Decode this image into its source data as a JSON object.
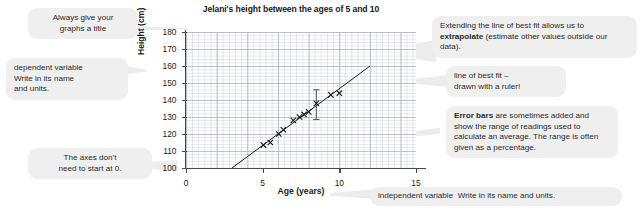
{
  "chart_data": {
    "type": "scatter",
    "title": "Jelani's height between the ages of 5 and 10",
    "xlabel": "Age (years)",
    "ylabel": "Height (cm)",
    "xlim": [
      0,
      15
    ],
    "ylim": [
      100,
      180
    ],
    "xticks": [
      0,
      5,
      10,
      15
    ],
    "yticks": [
      100,
      110,
      120,
      130,
      140,
      150,
      160,
      170,
      180
    ],
    "grid": true,
    "legend": "none",
    "marker": "x",
    "points": [
      {
        "x": 5.05,
        "y": 113.5
      },
      {
        "x": 5.5,
        "y": 115.0
      },
      {
        "x": 6.05,
        "y": 120.0
      },
      {
        "x": 6.35,
        "y": 122.5
      },
      {
        "x": 7.0,
        "y": 128.0
      },
      {
        "x": 7.4,
        "y": 130.0
      },
      {
        "x": 7.7,
        "y": 131.5
      },
      {
        "x": 8.0,
        "y": 133.0
      },
      {
        "x": 8.5,
        "y": 138.0
      },
      {
        "x": 9.45,
        "y": 143.0
      },
      {
        "x": 10.0,
        "y": 144.0
      }
    ],
    "error_bar": {
      "x": 8.5,
      "y": 138.0,
      "low": 128.5,
      "high": 146.0
    },
    "best_fit_line": {
      "x1": 3.0,
      "y1": 100.0,
      "x2": 12.0,
      "y2": 160.0
    }
  },
  "annotations": {
    "title_note": "Always give your\ngraphs a title",
    "dependent_note_line1": "dependent variable",
    "dependent_note_line2": "Write in its name",
    "dependent_note_line3": "and units.",
    "axes_note": "The axes don't\nneed to start at 0.",
    "extrapolate_pre": "Extending the line of best fit allows us to ",
    "extrapolate_bold": "extrapolate",
    "extrapolate_post": " (estimate other values outside our data).",
    "best_fit_note": "line of best fit –\ndrawn with a ruler!",
    "error_bars_bold": "Error bars",
    "error_bars_rest": " are sometimes added and show the range of readings used to calculate an average. The range is often given as a percentage.",
    "independent_note_bold": "independent variable",
    "independent_note_rest": "Write in its name and units."
  },
  "colors": {
    "bubble": "#efefef",
    "text": "#2b2b2b",
    "axis": "#4a4a4a",
    "grid_major": "#96a0af",
    "grid_minor": "#aab4c3",
    "data": "#1a1a1a"
  }
}
